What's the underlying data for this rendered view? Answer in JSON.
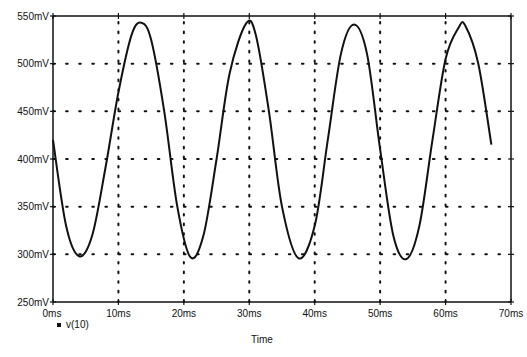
{
  "chart_data": {
    "type": "line",
    "title": "",
    "xlabel": "Time",
    "ylabel": "",
    "xlim": [
      0,
      70
    ],
    "ylim": [
      250,
      550
    ],
    "x_unit": "ms",
    "y_unit": "mV",
    "x_ticks": [
      "0ms",
      "10ms",
      "20ms",
      "30ms",
      "40ms",
      "50ms",
      "60ms",
      "70ms"
    ],
    "y_ticks": [
      "250mV",
      "300mV",
      "350mV",
      "400mV",
      "450mV",
      "500mV",
      "550mV"
    ],
    "grid": "dotted",
    "legend": [
      {
        "name": "v(10)",
        "marker": "square"
      }
    ],
    "legend_position": "bottom-left",
    "series": [
      {
        "name": "v(10)",
        "x": [
          0,
          2,
          4,
          6,
          8,
          10,
          12,
          13.5,
          15,
          17,
          19,
          21,
          23,
          25,
          27,
          29.5,
          31,
          33,
          35,
          37.5,
          40,
          42,
          44,
          46,
          48,
          50,
          52,
          54,
          56,
          58,
          60,
          62,
          63,
          65,
          67
        ],
        "values": [
          420,
          330,
          298,
          320,
          390,
          470,
          530,
          543,
          525,
          450,
          350,
          297,
          320,
          400,
          490,
          542,
          530,
          450,
          350,
          296,
          330,
          420,
          510,
          541,
          510,
          410,
          320,
          295,
          330,
          420,
          505,
          538,
          540,
          500,
          415
        ]
      }
    ]
  }
}
